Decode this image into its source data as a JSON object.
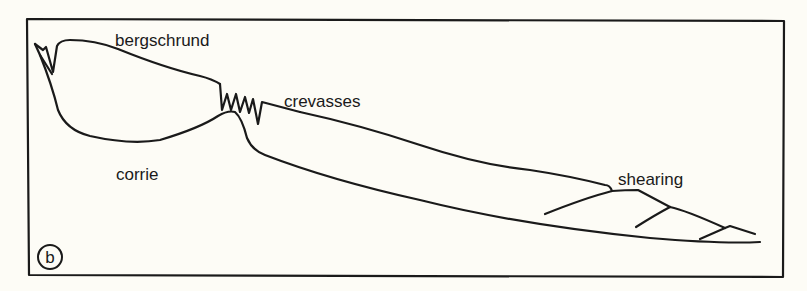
{
  "figure": {
    "panel_label": "b",
    "colors": {
      "background": "#fdfcf6",
      "ink": "#1a1a1a"
    },
    "labels": {
      "bergschrund": "bergschrund",
      "crevasses": "crevasses",
      "corrie": "corrie",
      "shearing": "shearing"
    }
  }
}
